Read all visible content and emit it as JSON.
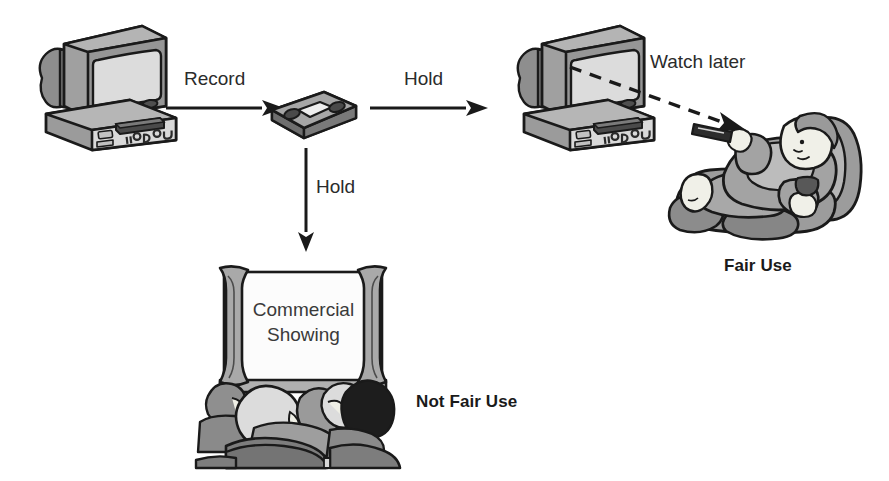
{
  "diagram": {
    "type": "flow-diagram",
    "background_color": "#ffffff",
    "ink_color": "#231f20",
    "palette": {
      "outline": "#1a1a1a",
      "gray_dark": "#6e6e6e",
      "gray_mid": "#9a9a9a",
      "gray_light": "#c9c9c9",
      "gray_pale": "#e3e3e3",
      "screen_fill": "#f7f7f7",
      "skin": "#efefe6",
      "black": "#171717"
    }
  },
  "nodes": [
    {
      "id": "tv-vcr-source",
      "name": "television-vcr-source",
      "caption": "",
      "kind": "illustration"
    },
    {
      "id": "vhs-tape",
      "name": "vhs-tape",
      "caption": "",
      "kind": "illustration"
    },
    {
      "id": "tv-vcr-playback",
      "name": "television-vcr-playback",
      "caption": "",
      "kind": "illustration"
    },
    {
      "id": "viewer-recliner",
      "name": "person-in-recliner",
      "caption": "Fair Use",
      "kind": "illustration"
    },
    {
      "id": "cinema",
      "name": "cinema-audience",
      "caption": "Not Fair Use",
      "kind": "illustration"
    }
  ],
  "edges": [
    {
      "id": "record",
      "label": "Record",
      "from": "tv-vcr-source",
      "to": "vhs-tape",
      "style": "solid",
      "direction": "right"
    },
    {
      "id": "hold-right",
      "label": "Hold",
      "from": "vhs-tape",
      "to": "tv-vcr-playback",
      "style": "solid",
      "direction": "right"
    },
    {
      "id": "hold-down",
      "label": "Hold",
      "from": "vhs-tape",
      "to": "cinema",
      "style": "solid",
      "direction": "down"
    },
    {
      "id": "watch-later",
      "label": "Watch later",
      "from": "tv-vcr-playback",
      "to": "viewer-recliner",
      "style": "dashed",
      "direction": "down-right"
    }
  ],
  "labels": {
    "record": "Record",
    "hold_right": "Hold",
    "hold_down": "Hold",
    "watch_later": "Watch later",
    "fair_use": "Fair Use",
    "not_fair_use": "Not Fair Use",
    "screen_line_1": "Commercial",
    "screen_line_2": "Showing"
  }
}
